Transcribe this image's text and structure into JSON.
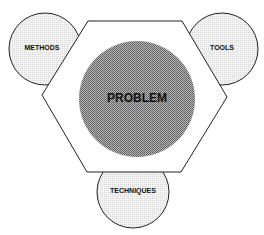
{
  "diagram": {
    "center": {
      "label": "PROBLEM"
    },
    "nodes": [
      {
        "id": "methods",
        "label": "METHODS"
      },
      {
        "id": "tools",
        "label": "TOOLS"
      },
      {
        "id": "techniques",
        "label": "TECHNIQUES"
      }
    ]
  },
  "colors": {
    "stroke": "#222222",
    "outer_circle_fill": "#ececec",
    "problem_fill": "#9a9a9a",
    "hexagon_fill": "#ffffff"
  }
}
